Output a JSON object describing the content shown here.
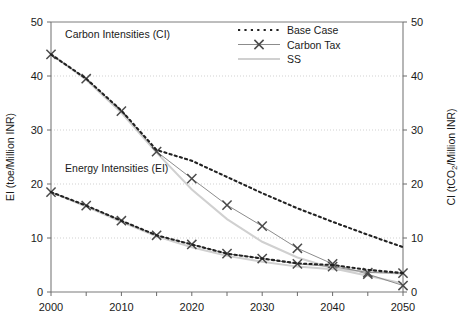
{
  "chart_data": {
    "type": "line",
    "title": "",
    "xlabel": "",
    "ylabel": "EI (toe/Million INR)",
    "y2label": "CI (tCO2/Million INR)",
    "y2label_parts": {
      "pre": "CI (tCO",
      "sub": "2",
      "post": "/Million INR)"
    },
    "x": [
      2000,
      2005,
      2010,
      2015,
      2020,
      2025,
      2030,
      2035,
      2040,
      2045,
      2050
    ],
    "xlim": [
      2000,
      2050
    ],
    "ylim": [
      0,
      50
    ],
    "y2lim": [
      0,
      50
    ],
    "yticks": [
      0,
      10,
      20,
      30,
      40,
      50
    ],
    "y2ticks": [
      0,
      10,
      20,
      30,
      40,
      50
    ],
    "xticks": [
      2000,
      2010,
      2020,
      2030,
      2040,
      2050
    ],
    "xticks_all": [
      2000,
      2005,
      2010,
      2015,
      2020,
      2025,
      2030,
      2035,
      2040,
      2045,
      2050
    ],
    "xtick_labels": [
      "2000",
      "2010",
      "2020",
      "2030",
      "2040",
      "2050"
    ],
    "grid": true,
    "grid_axis": "y",
    "legend_position": "top-center-right",
    "annotations": [
      {
        "text": "Carbon Intensities (CI)",
        "x": 2002,
        "y": 47.0
      },
      {
        "text": "Energy Intensities (EI)",
        "x": 2002,
        "y": 22.2
      }
    ],
    "groups": [
      {
        "name": "Carbon Intensities (CI)",
        "axis": "right",
        "series": [
          {
            "name": "Base Case",
            "style": "dotted",
            "color": "#222222",
            "values": [
              44.0,
              39.5,
              33.6,
              26.3,
              24.3,
              21.3,
              18.3,
              15.5,
              13.0,
              10.6,
              8.3
            ]
          },
          {
            "name": "Carbon Tax",
            "style": "line-x",
            "color": "#8c8c8c",
            "values": [
              44.0,
              39.5,
              33.5,
              26.0,
              21.0,
              16.1,
              12.2,
              8.1,
              5.2,
              3.3,
              1.2
            ]
          },
          {
            "name": "SS",
            "style": "line",
            "color": "#d0d0d0",
            "values": [
              44.0,
              39.3,
              33.2,
              25.8,
              19.0,
              13.5,
              9.3,
              6.4,
              4.4,
              3.0,
              1.6
            ]
          }
        ]
      },
      {
        "name": "Energy Intensities (EI)",
        "axis": "left",
        "series": [
          {
            "name": "Base Case",
            "style": "dotted",
            "color": "#222222",
            "values": [
              18.5,
              16.0,
              13.2,
              10.5,
              8.8,
              7.1,
              6.2,
              5.3,
              5.0,
              4.1,
              3.5
            ]
          },
          {
            "name": "Carbon Tax",
            "style": "line-x",
            "color": "#8c8c8c",
            "values": [
              18.5,
              16.0,
              13.2,
              10.5,
              8.8,
              7.1,
              6.2,
              5.2,
              4.7,
              3.6,
              3.5
            ]
          },
          {
            "name": "SS",
            "style": "line",
            "color": "#d0d0d0",
            "values": [
              18.5,
              15.8,
              13.0,
              10.3,
              8.3,
              6.7,
              5.6,
              4.7,
              4.2,
              3.8,
              3.4
            ]
          }
        ]
      }
    ],
    "legend": [
      {
        "label": "Base Case",
        "style": "dotted",
        "color": "#222222"
      },
      {
        "label": "Carbon Tax",
        "style": "line-x",
        "color": "#8c8c8c"
      },
      {
        "label": "SS",
        "style": "line",
        "color": "#d0d0d0"
      }
    ]
  }
}
